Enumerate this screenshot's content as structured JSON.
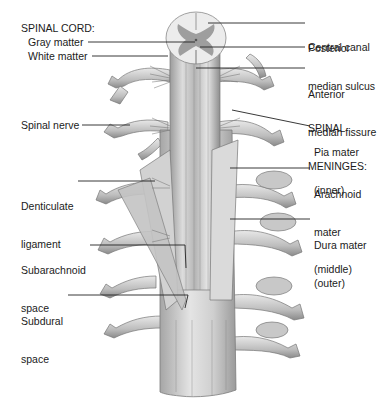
{
  "figure": {
    "colors": {
      "background": "#ffffff",
      "tissue_light": "#e2e2e2",
      "tissue_mid": "#b8b8b8",
      "tissue_dark": "#7d7d7d",
      "gray_matter": "#9a9a9a",
      "leader": "#222222",
      "text": "#1b1b1b"
    }
  },
  "labels_left": {
    "spinal_cord_heading": "SPINAL CORD:",
    "gray_matter": "Gray matter",
    "white_matter": "White matter",
    "spinal_nerve": "Spinal nerve",
    "denticulate_1": "Denticulate",
    "denticulate_2": "ligament",
    "subarachnoid_1": "Subarachnoid",
    "subarachnoid_2": "space",
    "subdural_1": "Subdural",
    "subdural_2": "space"
  },
  "labels_right": {
    "posterior_1": "Posterior",
    "posterior_2": "median sulcus",
    "central_canal": "Central canal",
    "anterior_1": "Anterior",
    "anterior_2": "median fissure",
    "meninges_1": "SPINAL",
    "meninges_2": "MENINGES:",
    "pia_1": "Pia mater",
    "pia_2": "(inner)",
    "arachnoid_1": "Arachnoid",
    "arachnoid_2": "mater",
    "arachnoid_3": "(middle)",
    "dura_1": "Dura mater",
    "dura_2": "(outer)"
  }
}
